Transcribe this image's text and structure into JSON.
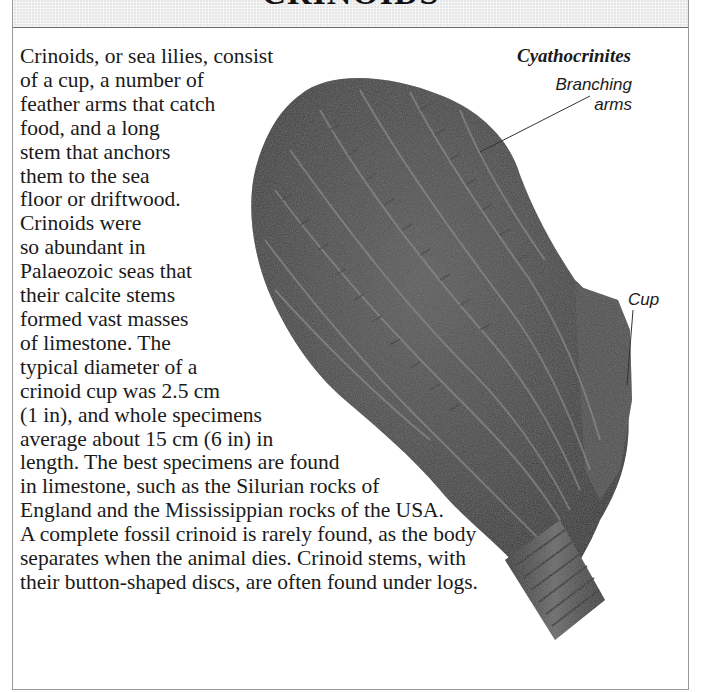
{
  "header": {
    "title": "CRINOIDS"
  },
  "figure": {
    "species_name": "Cyathocrinites",
    "labels": {
      "branching_arms": [
        "Branching",
        "arms"
      ],
      "cup": "Cup"
    },
    "image_alt": "Fossil crinoid Cyathocrinites showing branching arms, cup and stem"
  },
  "body": {
    "lines": [
      "Crinoids, or sea lilies, consist",
      "of a cup, a number of",
      "feather arms that catch",
      "food, and a long",
      "stem that anchors",
      "them to the sea",
      "floor or driftwood.",
      "Crinoids were",
      "so abundant in",
      "Palaeozoic seas that",
      "their calcite stems",
      "formed vast masses",
      "of limestone. The",
      "typical diameter of a",
      "crinoid cup was 2.5 cm",
      "(1 in), and whole specimens",
      "average about 15 cm (6 in) in",
      "length. The best specimens are found",
      "in limestone, such as the Silurian rocks of",
      "England and the Mississippian rocks of the USA.",
      "A complete fossil crinoid is rarely found, as the body",
      "separates when the animal dies. Crinoid stems, with",
      "their button-shaped discs, are often found under logs."
    ]
  }
}
